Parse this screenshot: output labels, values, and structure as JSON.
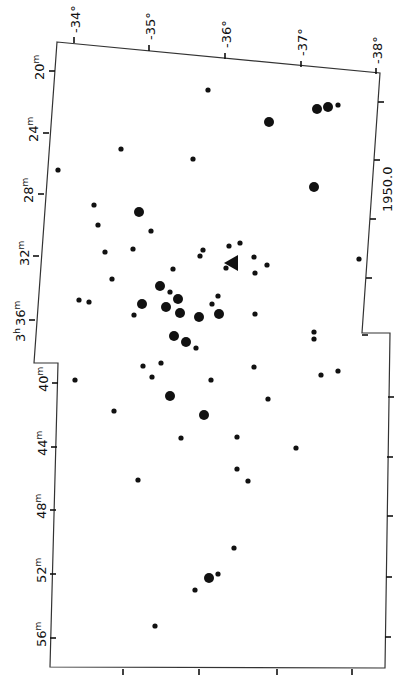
{
  "map": {
    "type": "star-chart",
    "epoch_label": "1950.0",
    "ra_labels": [
      {
        "text": "20m",
        "major": "20",
        "unit": "m"
      },
      {
        "text": "24m",
        "major": "24",
        "unit": "m"
      },
      {
        "text": "28m",
        "major": "28",
        "unit": "m"
      },
      {
        "text": "32m",
        "major": "32",
        "unit": "m"
      },
      {
        "text": "3h 36m",
        "major": "36",
        "unit": "m",
        "hour": "3",
        "hour_unit": "h"
      },
      {
        "text": "40m",
        "major": "40",
        "unit": "m"
      },
      {
        "text": "44m",
        "major": "44",
        "unit": "m"
      },
      {
        "text": "48m",
        "major": "48",
        "unit": "m"
      },
      {
        "text": "52m",
        "major": "52",
        "unit": "m"
      },
      {
        "text": "56m",
        "major": "56",
        "unit": "m"
      }
    ],
    "dec_labels": [
      "-34°",
      "-35°",
      "-36°",
      "-37°",
      "-38°"
    ],
    "colors": {
      "ink": "#111111",
      "background": "#ffffff"
    },
    "marker": {
      "type": "triangle-arrow",
      "x": 232,
      "y": 263
    }
  },
  "chart_data": {
    "type": "scatter",
    "title": "",
    "xlabel": "Declination (1950.0)",
    "ylabel": "Right Ascension (3h 20m – 3h 56m)",
    "x_ticks": [
      "-34°",
      "-35°",
      "-36°",
      "-37°",
      "-38°"
    ],
    "y_ticks": [
      "20m",
      "24m",
      "28m",
      "32m",
      "3h 36m",
      "40m",
      "44m",
      "48m",
      "52m",
      "56m"
    ],
    "grid": false,
    "stars": [
      {
        "x": 208,
        "y": 90,
        "size": "small"
      },
      {
        "x": 317,
        "y": 109,
        "size": "large"
      },
      {
        "x": 328,
        "y": 107,
        "size": "large"
      },
      {
        "x": 338,
        "y": 105,
        "size": "small"
      },
      {
        "x": 269,
        "y": 122,
        "size": "large"
      },
      {
        "x": 121,
        "y": 149,
        "size": "small"
      },
      {
        "x": 193,
        "y": 159,
        "size": "small"
      },
      {
        "x": 58,
        "y": 170,
        "size": "small"
      },
      {
        "x": 314,
        "y": 187,
        "size": "large"
      },
      {
        "x": 94,
        "y": 205,
        "size": "small"
      },
      {
        "x": 139,
        "y": 212,
        "size": "large"
      },
      {
        "x": 98,
        "y": 225,
        "size": "small"
      },
      {
        "x": 151,
        "y": 231,
        "size": "small"
      },
      {
        "x": 105,
        "y": 252,
        "size": "small"
      },
      {
        "x": 133,
        "y": 249,
        "size": "small"
      },
      {
        "x": 203,
        "y": 250,
        "size": "small"
      },
      {
        "x": 200,
        "y": 256,
        "size": "small"
      },
      {
        "x": 229,
        "y": 246,
        "size": "small"
      },
      {
        "x": 240,
        "y": 243,
        "size": "small"
      },
      {
        "x": 254,
        "y": 257,
        "size": "small"
      },
      {
        "x": 267,
        "y": 265,
        "size": "small"
      },
      {
        "x": 255,
        "y": 273,
        "size": "small"
      },
      {
        "x": 359,
        "y": 259,
        "size": "small"
      },
      {
        "x": 112,
        "y": 279,
        "size": "small"
      },
      {
        "x": 173,
        "y": 269,
        "size": "small"
      },
      {
        "x": 226,
        "y": 268,
        "size": "small"
      },
      {
        "x": 160,
        "y": 286,
        "size": "large"
      },
      {
        "x": 170,
        "y": 292,
        "size": "small"
      },
      {
        "x": 178,
        "y": 299,
        "size": "large"
      },
      {
        "x": 218,
        "y": 296,
        "size": "small"
      },
      {
        "x": 79,
        "y": 300,
        "size": "small"
      },
      {
        "x": 89,
        "y": 302,
        "size": "small"
      },
      {
        "x": 142,
        "y": 304,
        "size": "large"
      },
      {
        "x": 166,
        "y": 307,
        "size": "large"
      },
      {
        "x": 180,
        "y": 313,
        "size": "large"
      },
      {
        "x": 212,
        "y": 304,
        "size": "small"
      },
      {
        "x": 219,
        "y": 314,
        "size": "large"
      },
      {
        "x": 199,
        "y": 317,
        "size": "large"
      },
      {
        "x": 255,
        "y": 314,
        "size": "small"
      },
      {
        "x": 134,
        "y": 315,
        "size": "small"
      },
      {
        "x": 174,
        "y": 336,
        "size": "large"
      },
      {
        "x": 186,
        "y": 342,
        "size": "large"
      },
      {
        "x": 196,
        "y": 348,
        "size": "small"
      },
      {
        "x": 314,
        "y": 332,
        "size": "small"
      },
      {
        "x": 314,
        "y": 339,
        "size": "small"
      },
      {
        "x": 143,
        "y": 366,
        "size": "small"
      },
      {
        "x": 161,
        "y": 363,
        "size": "small"
      },
      {
        "x": 254,
        "y": 367,
        "size": "small"
      },
      {
        "x": 152,
        "y": 377,
        "size": "small"
      },
      {
        "x": 211,
        "y": 380,
        "size": "small"
      },
      {
        "x": 75,
        "y": 380,
        "size": "small"
      },
      {
        "x": 321,
        "y": 375,
        "size": "small"
      },
      {
        "x": 338,
        "y": 371,
        "size": "small"
      },
      {
        "x": 170,
        "y": 396,
        "size": "large"
      },
      {
        "x": 268,
        "y": 399,
        "size": "small"
      },
      {
        "x": 114,
        "y": 411,
        "size": "small"
      },
      {
        "x": 204,
        "y": 415,
        "size": "large"
      },
      {
        "x": 181,
        "y": 438,
        "size": "small"
      },
      {
        "x": 237,
        "y": 437,
        "size": "small"
      },
      {
        "x": 296,
        "y": 448,
        "size": "small"
      },
      {
        "x": 138,
        "y": 480,
        "size": "small"
      },
      {
        "x": 237,
        "y": 469,
        "size": "small"
      },
      {
        "x": 248,
        "y": 481,
        "size": "small"
      },
      {
        "x": 234,
        "y": 548,
        "size": "small"
      },
      {
        "x": 209,
        "y": 578,
        "size": "large"
      },
      {
        "x": 218,
        "y": 574,
        "size": "small"
      },
      {
        "x": 195,
        "y": 590,
        "size": "small"
      },
      {
        "x": 155,
        "y": 626,
        "size": "small"
      }
    ]
  }
}
